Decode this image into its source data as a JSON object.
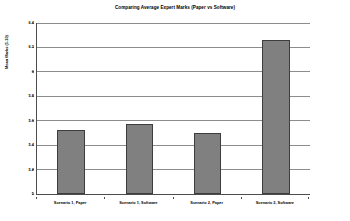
{
  "chart_data": {
    "type": "bar",
    "title": "Comparing Average Expert Marks (Paper vs Software)",
    "xlabel": "",
    "ylabel": "Mean Marks (1-10)",
    "categories": [
      "Scenario 1, Paper",
      "Scenario 1, Software",
      "Scenario 2, Paper",
      "Scenario 2, Software"
    ],
    "values": [
      5.52,
      5.57,
      5.5,
      6.26
    ],
    "ylim": [
      5,
      6.4
    ],
    "ytick_labels": [
      "5",
      "5.2",
      "5.4",
      "5.6",
      "5.8",
      "6",
      "6.2",
      "6.4"
    ],
    "ytick_values": [
      5,
      5.2,
      5.4,
      5.6,
      5.8,
      6,
      6.2,
      6.4
    ],
    "grid": true,
    "legend": false,
    "legend_position": "none",
    "bar_color": "#808080",
    "bar_border_color": "#3d3d3d",
    "gridline_color": "#8c8c8c",
    "axis_color": "#4d4d4d",
    "background_color": "#ffffff"
  }
}
